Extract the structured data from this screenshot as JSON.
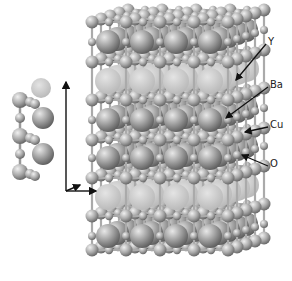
{
  "diagram": {
    "title": "",
    "labels": [
      {
        "id": "y",
        "text": "Y",
        "x": 268,
        "y": 38,
        "tipX": 236,
        "tipY": 80
      },
      {
        "id": "ba",
        "text": "Ba",
        "x": 270,
        "y": 81,
        "tipX": 226,
        "tipY": 118
      },
      {
        "id": "cu",
        "text": "Cu",
        "x": 270,
        "y": 121,
        "tipX": 245,
        "tipY": 132
      },
      {
        "id": "o",
        "text": "O",
        "x": 270,
        "y": 160,
        "tipX": 242,
        "tipY": 155
      }
    ],
    "colors": {
      "background": "#ffffff",
      "atom_dark": "#8a8a8a",
      "atom_light": "#d6d6d6",
      "y_layer": "#c9c9c9",
      "arrow": "#111111"
    }
  }
}
